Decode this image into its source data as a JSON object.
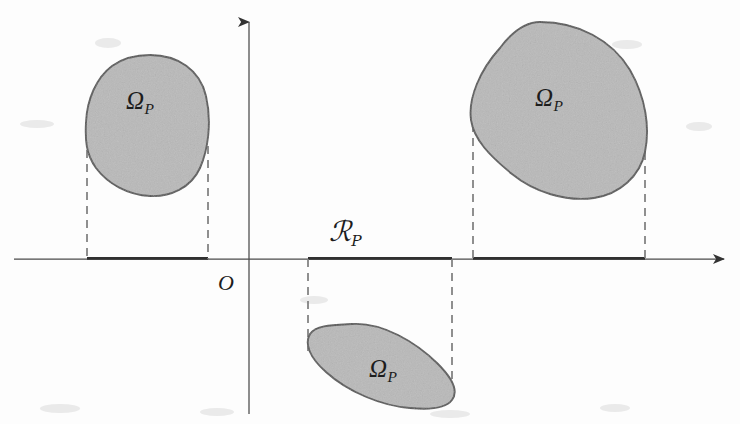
{
  "figure": {
    "name": "projection-diagram",
    "width": 740,
    "height": 424,
    "background_color": "#fdfdfd",
    "ink_color": "#3a3a3a",
    "region_fill_color": "#b9b9b9",
    "region_stroke_color": "#555555",
    "dash_color": "#7a7a7a"
  },
  "axes": {
    "origin_label": "O",
    "x_axis": {
      "name": "x-axis",
      "y": 259,
      "x_start": 14,
      "x_end": 730,
      "arrow": "right"
    },
    "y_axis": {
      "name": "y-axis",
      "x": 249,
      "y_start": 414,
      "y_end": 10,
      "arrow": "up"
    }
  },
  "regions": [
    {
      "id": "region-left",
      "label": "Ω",
      "label_subscript": "P",
      "label_x": 140,
      "label_y": 100,
      "x_min": 85,
      "x_max": 208,
      "y_min": 55,
      "y_max": 196
    },
    {
      "id": "region-right",
      "label": "Ω",
      "label_subscript": "P",
      "label_x": 549,
      "label_y": 97,
      "x_min": 470,
      "x_max": 648,
      "y_min": 22,
      "y_max": 198
    },
    {
      "id": "region-bottom",
      "label": "Ω",
      "label_subscript": "P",
      "label_x": 383,
      "label_y": 368,
      "x_min": 306,
      "x_max": 456,
      "y_min": 322,
      "y_max": 410
    }
  ],
  "projection_label": {
    "name": "projection-interval-label",
    "symbol": "ℛ",
    "subscript": "P",
    "x": 345,
    "y": 232
  },
  "projection_intervals": [
    {
      "id": "interval-left",
      "x_start": 87,
      "x_end": 208
    },
    {
      "id": "interval-bottom",
      "x_start": 308,
      "x_end": 452
    },
    {
      "id": "interval-right",
      "x_start": 473,
      "x_end": 645
    }
  ],
  "dashed_guides": [
    {
      "id": "guide-left-a",
      "x": 87,
      "y_top": 150,
      "y_bottom": 259
    },
    {
      "id": "guide-left-b",
      "x": 208,
      "y_top": 146,
      "y_bottom": 259
    },
    {
      "id": "guide-bottom-a",
      "x": 308,
      "y_top": 259,
      "y_bottom": 352
    },
    {
      "id": "guide-bottom-b",
      "x": 452,
      "y_top": 259,
      "y_bottom": 394
    },
    {
      "id": "guide-right-a",
      "x": 473,
      "y_top": 124,
      "y_bottom": 259
    },
    {
      "id": "guide-right-b",
      "x": 645,
      "y_top": 152,
      "y_bottom": 259
    }
  ]
}
